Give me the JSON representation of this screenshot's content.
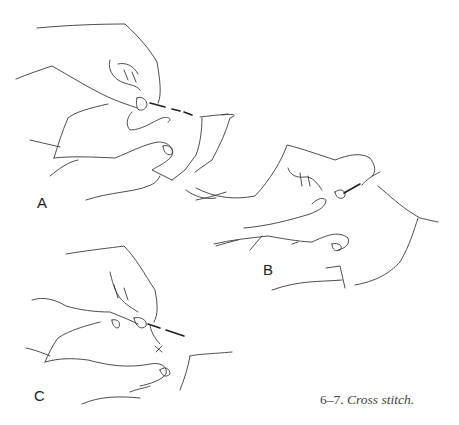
{
  "figure": {
    "panels": [
      {
        "label": "A",
        "description": "hand holding needle inserting into fabric, second hand below"
      },
      {
        "label": "B",
        "description": "needle pulled through fabric, hands repositioned"
      },
      {
        "label": "C",
        "description": "needle crossing to form X stitch"
      }
    ],
    "caption": {
      "number": "6–7.",
      "title": "Cross stitch."
    },
    "colors": {
      "ink": "#3a3a3a",
      "background": "#ffffff",
      "caption_text": "#444444"
    }
  }
}
